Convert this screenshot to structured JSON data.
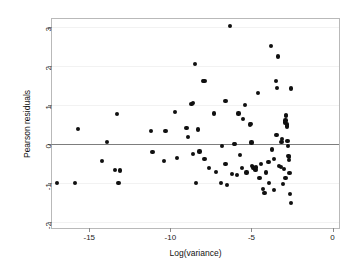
{
  "chart_data": {
    "type": "scatter",
    "title": "",
    "xlabel": "Log(variance)",
    "ylabel": "Pearson residuals",
    "xlim": [
      -17.3,
      0.4
    ],
    "ylim": [
      -2.15,
      3.2
    ],
    "xticks": [
      -15,
      -10,
      -5,
      0
    ],
    "xtick_labels": [
      "-15",
      "-10",
      "-5",
      "0"
    ],
    "yticks": [
      -2,
      -1,
      0,
      1,
      2,
      3
    ],
    "ytick_labels": [
      "-2",
      "-1",
      "0",
      "1",
      "2",
      "3"
    ],
    "grid": true,
    "grid_axis": "y",
    "reference_lines": [
      {
        "axis": "y",
        "value": 0,
        "color": "#7d7d7d"
      }
    ],
    "marker": {
      "shape": "circle",
      "color": "#101010",
      "size": 4.2
    },
    "legend": null,
    "points": [
      {
        "x": -17.0,
        "y": -1.0
      },
      {
        "x": -15.9,
        "y": -1.0
      },
      {
        "x": -15.7,
        "y": 0.38
      },
      {
        "x": -14.2,
        "y": -0.43
      },
      {
        "x": -13.9,
        "y": 0.06
      },
      {
        "x": -13.4,
        "y": -0.66
      },
      {
        "x": -13.3,
        "y": 0.77
      },
      {
        "x": -13.2,
        "y": -1.0
      },
      {
        "x": -13.1,
        "y": -0.68
      },
      {
        "x": -11.2,
        "y": 0.33
      },
      {
        "x": -11.1,
        "y": -0.21
      },
      {
        "x": -10.4,
        "y": -0.44
      },
      {
        "x": -10.3,
        "y": 0.34
      },
      {
        "x": -9.7,
        "y": 0.81
      },
      {
        "x": -9.6,
        "y": -0.36
      },
      {
        "x": -9.0,
        "y": 0.41
      },
      {
        "x": -8.9,
        "y": 0.17
      },
      {
        "x": -8.7,
        "y": 1.03
      },
      {
        "x": -8.6,
        "y": 1.05
      },
      {
        "x": -8.6,
        "y": -0.26
      },
      {
        "x": -8.5,
        "y": 2.05
      },
      {
        "x": -8.4,
        "y": -1.0
      },
      {
        "x": -8.3,
        "y": 0.37
      },
      {
        "x": -8.2,
        "y": -0.19
      },
      {
        "x": -8.0,
        "y": 1.62
      },
      {
        "x": -7.9,
        "y": 1.61
      },
      {
        "x": -7.9,
        "y": -0.39
      },
      {
        "x": -7.6,
        "y": -0.62
      },
      {
        "x": -7.3,
        "y": 0.78
      },
      {
        "x": -7.2,
        "y": -0.72
      },
      {
        "x": -6.9,
        "y": -1.0
      },
      {
        "x": -6.8,
        "y": -0.06
      },
      {
        "x": -6.6,
        "y": 1.11
      },
      {
        "x": -6.6,
        "y": -0.52
      },
      {
        "x": -6.5,
        "y": -1.04
      },
      {
        "x": -6.3,
        "y": 3.02
      },
      {
        "x": -6.2,
        "y": -0.76
      },
      {
        "x": -6.1,
        "y": 0.0
      },
      {
        "x": -6.0,
        "y": -0.01
      },
      {
        "x": -5.9,
        "y": -0.79
      },
      {
        "x": -5.8,
        "y": 0.78
      },
      {
        "x": -5.7,
        "y": -0.28
      },
      {
        "x": -5.6,
        "y": -0.62
      },
      {
        "x": -5.5,
        "y": 0.63
      },
      {
        "x": -5.4,
        "y": 1.0
      },
      {
        "x": -5.3,
        "y": -0.73
      },
      {
        "x": -5.1,
        "y": 0.5
      },
      {
        "x": -5.05,
        "y": 0.52
      },
      {
        "x": -5.0,
        "y": 0.04
      },
      {
        "x": -4.95,
        "y": -0.57
      },
      {
        "x": -4.9,
        "y": -0.6
      },
      {
        "x": -4.85,
        "y": -0.62
      },
      {
        "x": -4.8,
        "y": -0.64
      },
      {
        "x": -4.75,
        "y": -0.66
      },
      {
        "x": -4.7,
        "y": -0.6
      },
      {
        "x": -4.6,
        "y": 1.3
      },
      {
        "x": -4.5,
        "y": -0.86
      },
      {
        "x": -4.4,
        "y": -0.51
      },
      {
        "x": -4.3,
        "y": -1.15
      },
      {
        "x": -4.2,
        "y": -1.25
      },
      {
        "x": -4.1,
        "y": -0.73
      },
      {
        "x": -3.9,
        "y": -1.0
      },
      {
        "x": -3.8,
        "y": 2.5
      },
      {
        "x": -3.75,
        "y": -0.14
      },
      {
        "x": -3.6,
        "y": -1.18
      },
      {
        "x": -3.5,
        "y": 1.62
      },
      {
        "x": -3.45,
        "y": 0.24
      },
      {
        "x": -3.4,
        "y": 1.43
      },
      {
        "x": -3.35,
        "y": 2.24
      },
      {
        "x": -3.3,
        "y": -0.56
      },
      {
        "x": -3.2,
        "y": -0.59
      },
      {
        "x": -3.15,
        "y": 0.06
      },
      {
        "x": -3.1,
        "y": 0.12
      },
      {
        "x": -3.05,
        "y": -1.02
      },
      {
        "x": -3.0,
        "y": -0.63
      },
      {
        "x": -2.95,
        "y": 0.55
      },
      {
        "x": -2.9,
        "y": 0.6
      },
      {
        "x": -2.88,
        "y": 0.72
      },
      {
        "x": -2.85,
        "y": 0.75
      },
      {
        "x": -2.82,
        "y": 0.45
      },
      {
        "x": -2.8,
        "y": 0.5
      },
      {
        "x": -2.78,
        "y": 0.08
      },
      {
        "x": -2.75,
        "y": -0.05
      },
      {
        "x": -2.72,
        "y": -0.3
      },
      {
        "x": -2.7,
        "y": -0.33
      },
      {
        "x": -2.68,
        "y": -0.4
      },
      {
        "x": -2.65,
        "y": -0.75
      },
      {
        "x": -2.6,
        "y": -1.28
      },
      {
        "x": -2.58,
        "y": -1.5
      },
      {
        "x": -2.55,
        "y": 1.42
      },
      {
        "x": -2.9,
        "y": -0.88
      },
      {
        "x": -3.6,
        "y": -0.38
      },
      {
        "x": -3.95,
        "y": -0.47
      }
    ]
  },
  "axes": {
    "x_label": "Log(variance)",
    "y_label": "Pearson residuals"
  }
}
